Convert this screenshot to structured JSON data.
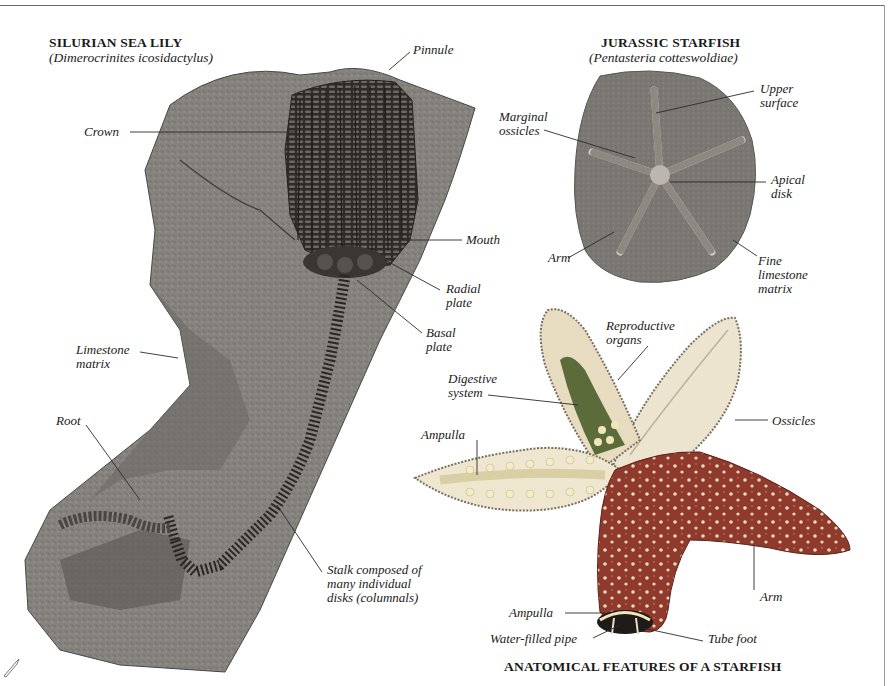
{
  "page": {
    "background": "#ffffff",
    "rule_color": "#6a6a6a"
  },
  "sea_lily": {
    "title": "SILURIAN SEA LILY",
    "species": "(Dimerocrinites icosidactylus)",
    "labels": {
      "pinnule": "Pinnule",
      "crown": "Crown",
      "mouth": "Mouth",
      "radial_plate": [
        "Radial",
        "plate"
      ],
      "basal_plate": [
        "Basal",
        "plate"
      ],
      "limestone_matrix": [
        "Limestone",
        "matrix"
      ],
      "root": "Root",
      "stalk": [
        "Stalk composed of",
        "many individual",
        "disks (columnals)"
      ]
    },
    "colors": {
      "rock": "#8a8782",
      "rock_dark": "#5e5b57",
      "fossil": "#3e3a36"
    }
  },
  "jurassic_starfish": {
    "title": "JURASSIC STARFISH",
    "species": "(Pentasteria cotteswoldiae)",
    "labels": {
      "upper_surface": [
        "Upper",
        "surface"
      ],
      "marginal_ossicles": [
        "Marginal",
        "ossicles"
      ],
      "apical_disk": [
        "Apical",
        "disk"
      ],
      "arm": "Arm",
      "fine_limestone_matrix": [
        "Fine",
        "limestone",
        "matrix"
      ]
    },
    "colors": {
      "matrix": "#807c78",
      "star": "#c9c5bf"
    }
  },
  "anatomy": {
    "title": "ANATOMICAL FEATURES OF A STARFISH",
    "labels": {
      "reproductive_organs": [
        "Reproductive",
        "organs"
      ],
      "digestive_system": [
        "Digestive",
        "system"
      ],
      "ampulla_upper": "Ampulla",
      "ossicles": "Ossicles",
      "arm": "Arm",
      "ampulla_lower": "Ampulla",
      "water_filled_pipe": "Water-filled pipe",
      "tube_foot": "Tube foot"
    },
    "colors": {
      "body": "#8f3a2c",
      "dots": "#e9dcc4",
      "cut": "#efe6cf",
      "organs": "#5b6b3a",
      "ampullae": "#f1e6b8"
    }
  }
}
